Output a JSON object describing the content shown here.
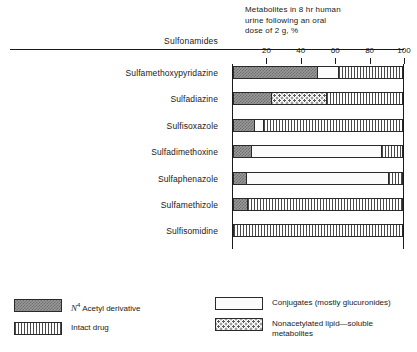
{
  "header": {
    "note": "Metabolites in 8 hr human\nurine following an oral\ndose of 2 g, %",
    "category_axis_title": "Sulfonamides"
  },
  "legend": {
    "acetyl_label_prefix": "N",
    "acetyl_label_sup": "4",
    "acetyl_label": " Acetyl derivative",
    "intact_label": "Intact drug",
    "conjugates_label": "Conjugates (mostly glucuronides)",
    "nonacetylated_label": "Nonacetylated lipid—soluble\n      metabolites"
  },
  "chart_data": {
    "type": "bar",
    "orientation": "horizontal",
    "stacked": true,
    "title": "Metabolites in 8 hr human urine following an oral dose of 2 g, %",
    "xlabel": "",
    "ylabel": "Sulfonamides",
    "xlim": [
      0,
      100
    ],
    "xticks": [
      20,
      40,
      60,
      80,
      100
    ],
    "xtick_labels": [
      "20",
      "40",
      "60",
      "80",
      "100"
    ],
    "grid": false,
    "legend_position": "bottom",
    "categories": [
      "Sulfamethoxypyridazine",
      "Sulfadiazine",
      "Sulfisoxazole",
      "Sulfadimethoxine",
      "Sulfaphenazole",
      "Sulfamethizole",
      "Sulfisomidine"
    ],
    "series": [
      {
        "name": "N4 Acetyl derivative",
        "pattern": "checker-dark-gray",
        "values": [
          50,
          22,
          12,
          10,
          7,
          8,
          0
        ]
      },
      {
        "name": "Conjugates (mostly glucuronides)",
        "pattern": "fine-dots",
        "values": [
          12,
          0,
          5,
          78,
          85,
          0,
          0
        ]
      },
      {
        "name": "Nonacetylated lipid-soluble metabolites",
        "pattern": "coarse-dots",
        "values": [
          0,
          33,
          0,
          0,
          0,
          0,
          0
        ]
      },
      {
        "name": "Intact drug",
        "pattern": "vertical-stripes",
        "values": [
          38,
          45,
          83,
          12,
          8,
          92,
          100
        ]
      }
    ],
    "rows": [
      {
        "category": "Sulfamethoxypyridazine",
        "segments": [
          {
            "series": "N4 Acetyl derivative",
            "value": 50
          },
          {
            "series": "Conjugates (mostly glucuronides)",
            "value": 12
          },
          {
            "series": "Intact drug",
            "value": 38
          }
        ]
      },
      {
        "category": "Sulfadiazine",
        "segments": [
          {
            "series": "N4 Acetyl derivative",
            "value": 22
          },
          {
            "series": "Nonacetylated lipid-soluble metabolites",
            "value": 33
          },
          {
            "series": "Intact drug",
            "value": 45
          }
        ]
      },
      {
        "category": "Sulfisoxazole",
        "segments": [
          {
            "series": "N4 Acetyl derivative",
            "value": 12
          },
          {
            "series": "Conjugates (mostly glucuronides)",
            "value": 5
          },
          {
            "series": "Intact drug",
            "value": 83
          }
        ]
      },
      {
        "category": "Sulfadimethoxine",
        "segments": [
          {
            "series": "N4 Acetyl derivative",
            "value": 10
          },
          {
            "series": "Conjugates (mostly glucuronides)",
            "value": 78
          },
          {
            "series": "Intact drug",
            "value": 12
          }
        ]
      },
      {
        "category": "Sulfaphenazole",
        "segments": [
          {
            "series": "N4 Acetyl derivative",
            "value": 7
          },
          {
            "series": "Conjugates (mostly glucuronides)",
            "value": 85
          },
          {
            "series": "Intact drug",
            "value": 8
          }
        ]
      },
      {
        "category": "Sulfamethizole",
        "segments": [
          {
            "series": "N4 Acetyl derivative",
            "value": 8
          },
          {
            "series": "Intact drug",
            "value": 92
          }
        ]
      },
      {
        "category": "Sulfisomidine",
        "segments": [
          {
            "series": "Intact drug",
            "value": 100
          }
        ]
      }
    ]
  },
  "colors": {
    "ink": "#1a1a1a",
    "acetyl_fill": "#8a8a8a",
    "background": "#ffffff"
  }
}
